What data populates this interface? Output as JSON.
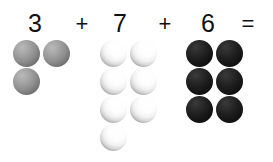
{
  "canvas": {
    "width": 273,
    "height": 162,
    "background_color": "#ffffff"
  },
  "equation": {
    "full_text": "3 + 7 + 6 =",
    "text_color": "#111111",
    "tokens": [
      {
        "label": "3",
        "kind": "addend",
        "x": 27,
        "y": 11
      },
      {
        "label": "+",
        "kind": "operator",
        "x": 74,
        "y": 13
      },
      {
        "label": "7",
        "kind": "addend",
        "x": 112,
        "y": 11
      },
      {
        "label": "+",
        "kind": "operator",
        "x": 157,
        "y": 13
      },
      {
        "label": "6",
        "kind": "addend",
        "x": 200,
        "y": 11
      },
      {
        "label": "=",
        "kind": "operator",
        "x": 240,
        "y": 13
      }
    ]
  },
  "groups": [
    {
      "name": "grey-group",
      "count": 3,
      "count_label": "3",
      "sphere_style": "grey",
      "color": "#8f8f8f",
      "spheres": [
        {
          "x": 13,
          "y": 40
        },
        {
          "x": 43,
          "y": 40
        },
        {
          "x": 13,
          "y": 68
        }
      ]
    },
    {
      "name": "light-group",
      "count": 7,
      "count_label": "7",
      "sphere_style": "light",
      "color": "#f2f2f2",
      "spheres": [
        {
          "x": 100,
          "y": 40
        },
        {
          "x": 130,
          "y": 40
        },
        {
          "x": 100,
          "y": 68
        },
        {
          "x": 130,
          "y": 68
        },
        {
          "x": 100,
          "y": 96
        },
        {
          "x": 130,
          "y": 96
        },
        {
          "x": 100,
          "y": 124
        }
      ]
    },
    {
      "name": "dark-group",
      "count": 6,
      "count_label": "6",
      "sphere_style": "dark",
      "color": "#151515",
      "spheres": [
        {
          "x": 186,
          "y": 40
        },
        {
          "x": 216,
          "y": 40
        },
        {
          "x": 186,
          "y": 68
        },
        {
          "x": 216,
          "y": 68
        },
        {
          "x": 186,
          "y": 96
        },
        {
          "x": 216,
          "y": 96
        }
      ]
    }
  ]
}
